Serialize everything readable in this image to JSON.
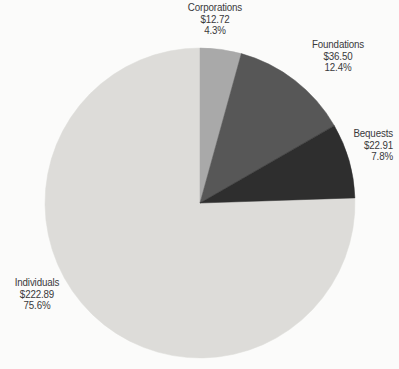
{
  "chart_data": {
    "type": "pie",
    "title": "",
    "subtitle": "",
    "xlabel": "",
    "ylabel": "",
    "legend_position": "outside-labels",
    "grid": false,
    "start_angle_deg": 0,
    "direction": "clockwise",
    "value_prefix": "$",
    "total_value": "295.02",
    "categories": [
      "Corporations",
      "Foundations",
      "Bequests",
      "Individuals"
    ],
    "values": [
      12.72,
      36.5,
      22.91,
      222.89
    ],
    "percents": [
      4.3,
      12.4,
      7.8,
      75.6
    ],
    "colors": [
      "#a9a9a9",
      "#575757",
      "#2e2e2e",
      "#dddcd9"
    ],
    "slices": [
      {
        "name": "Corporations",
        "value": 12.72,
        "percent": 4.3,
        "color": "#a9a9a9",
        "label_name": "Corporations",
        "label_value": "$12.72",
        "label_percent": "4.3%"
      },
      {
        "name": "Foundations",
        "value": 36.5,
        "percent": 12.4,
        "color": "#575757",
        "label_name": "Foundations",
        "label_value": "$36.50",
        "label_percent": "12.4%"
      },
      {
        "name": "Bequests",
        "value": 22.91,
        "percent": 7.8,
        "color": "#2e2e2e",
        "label_name": "Bequests",
        "label_value": "$22.91",
        "label_percent": "7.8%"
      },
      {
        "name": "Individuals",
        "value": 222.89,
        "percent": 75.6,
        "color": "#dddcd9",
        "label_name": "Individuals",
        "label_value": "$222.89",
        "label_percent": "75.6%"
      }
    ]
  },
  "figure": {
    "background_color": "#fbfbfa",
    "text_color": "#39393a",
    "center_x": 200,
    "center_y": 203,
    "radius": 155
  }
}
